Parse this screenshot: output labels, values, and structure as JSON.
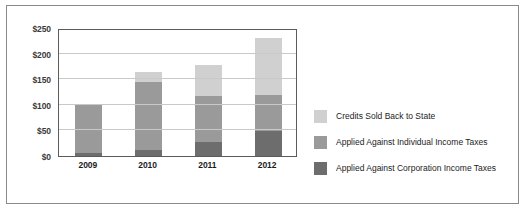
{
  "chart_data": {
    "type": "bar",
    "subtype": "stacked-bar",
    "title": "",
    "xlabel": "",
    "ylabel": "",
    "categories": [
      "2009",
      "2010",
      "2011",
      "2012"
    ],
    "series": [
      {
        "name": "Applied Against Corporation Income Taxes",
        "color": "#6d6d6d",
        "values": [
          5,
          12,
          28,
          48
        ]
      },
      {
        "name": "Applied Against Individual Income Taxes",
        "color": "#9a9a9a",
        "values": [
          95,
          133,
          89,
          72
        ]
      },
      {
        "name": "Credits Sold Back to State",
        "color": "#d0d0d0",
        "values": [
          0,
          20,
          61,
          110
        ]
      }
    ],
    "totals": [
      100,
      165,
      178,
      230
    ],
    "ylim": [
      0,
      250
    ],
    "ytick_values": [
      0,
      50,
      100,
      150,
      200,
      250
    ],
    "ytick_labels": [
      "$0",
      "$50",
      "$100",
      "$150",
      "$200",
      "$250"
    ],
    "grid": true,
    "grid_axis": "y",
    "legend_position": "right",
    "legend_order_top_to_bottom": [
      "Credits Sold Back to State",
      "Applied Against Individual Income Taxes",
      "Applied Against Corporation Income Taxes"
    ]
  },
  "legend": {
    "items": [
      {
        "label": "Credits Sold Back to State",
        "color": "#d0d0d0"
      },
      {
        "label": "Applied Against Individual Income Taxes",
        "color": "#9a9a9a"
      },
      {
        "label": "Applied Against Corporation Income Taxes",
        "color": "#6d6d6d"
      }
    ]
  },
  "axes": {
    "y_labels": [
      "$250",
      "$200",
      "$150",
      "$100",
      "$50",
      "$0"
    ],
    "x_labels": [
      "2009",
      "2010",
      "2011",
      "2012"
    ]
  },
  "style": {
    "frame_color": "#8a8a8a",
    "axis_color": "#5b5b5b",
    "gridline_color": "#c9c9c9",
    "background": "#ffffff"
  }
}
